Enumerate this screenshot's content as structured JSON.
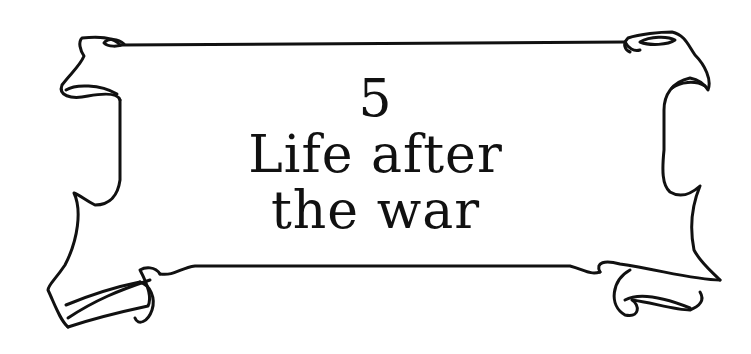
{
  "banner": {
    "chapter_number": "5",
    "title_line_1": "Life after",
    "title_line_2": "the war",
    "ink_color": "#111111",
    "paper_color": "#ffffff"
  }
}
